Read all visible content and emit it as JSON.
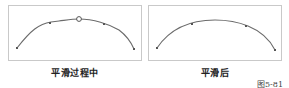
{
  "figure": {
    "label": "图5-81",
    "panels": [
      {
        "caption": "平滑过程中",
        "curve": "arc with anchor points, one anchor highlighted by hollow circle",
        "anchors": [
          "left-end",
          "left-mid",
          "top-selected-circle",
          "right-mid",
          "right-end"
        ]
      },
      {
        "caption": "平滑后",
        "curve": "smooth arc with anchor points",
        "anchors": [
          "left-end",
          "left-mid",
          "right-mid",
          "right-end"
        ]
      }
    ],
    "colors": {
      "curve": "#6b6b6b",
      "border": "#c9c9c9",
      "anchor": "#555555"
    }
  }
}
